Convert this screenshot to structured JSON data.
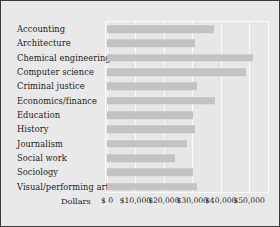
{
  "chart_data": {
    "type": "bar",
    "orientation": "horizontal",
    "title": "",
    "xlabel": "Dollars",
    "ylabel": "",
    "grid": true,
    "legend": null,
    "xlim": [
      0,
      57000
    ],
    "xticks": [
      0,
      10000,
      20000,
      30000,
      40000,
      50000
    ],
    "xtick_labels": [
      "$ 0",
      "$10,000",
      "$20,000",
      "$30,000",
      "$40,000",
      "$50,000"
    ],
    "categories": [
      "Accounting",
      "Architecture",
      "Chemical engineering",
      "Computer science",
      "Criminal justice",
      "Economics/finance",
      "Education",
      "History",
      "Journalism",
      "Social work",
      "Sociology",
      "Visual/performing arts"
    ],
    "values": [
      37700,
      31100,
      51400,
      49000,
      31500,
      38100,
      30400,
      31100,
      28000,
      24100,
      30400,
      31800
    ],
    "bar_color": "#c3c3c3",
    "plot_background": "#e7e7e7",
    "figure_background": "#e8e8e8"
  }
}
